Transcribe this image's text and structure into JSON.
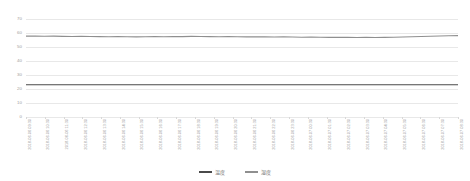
{
  "chart_data": {
    "type": "line",
    "title": "",
    "subtitle": "",
    "xlabel": "",
    "ylabel": "",
    "ylim": [
      0,
      70
    ],
    "yticks": [
      0,
      10,
      20,
      30,
      40,
      50,
      60,
      70
    ],
    "grid": true,
    "legend_position": "bottom-center",
    "x_tick_rotation": -90,
    "x": [
      "2018-06-06 09:30",
      "2018-06-06 10:00",
      "2018-06-06 10:30",
      "2018-06-06 11:00",
      "2018-06-06 11:30",
      "2018-06-06 12:00",
      "2018-06-06 12:30",
      "2018-06-06 13:00",
      "2018-06-06 13:30",
      "2018-06-06 14:00",
      "2018-06-06 14:30",
      "2018-06-06 15:00",
      "2018-06-06 15:30",
      "2018-06-06 16:00",
      "2018-06-06 16:30",
      "2018-06-06 17:00",
      "2018-06-06 17:30",
      "2018-06-06 18:00",
      "2018-06-06 18:30",
      "2018-06-06 19:00",
      "2018-06-06 19:30",
      "2018-06-06 20:00",
      "2018-06-06 20:30",
      "2018-06-06 21:00",
      "2018-06-06 21:30",
      "2018-06-06 22:00",
      "2018-06-06 22:30",
      "2018-06-06 23:00",
      "2018-06-06 23:30",
      "2018-06-07 00:00",
      "2018-06-07 00:30",
      "2018-06-07 01:00",
      "2018-06-07 01:30",
      "2018-06-07 02:00",
      "2018-06-07 02:30",
      "2018-06-07 03:00",
      "2018-06-07 03:30",
      "2018-06-07 04:00",
      "2018-06-07 04:30",
      "2018-06-07 05:00",
      "2018-06-07 05:30",
      "2018-06-07 06:00",
      "2018-06-07 06:30",
      "2018-06-07 07:00",
      "2018-06-07 07:30",
      "2018-06-07 08:00",
      "2018-06-07 08:30",
      "2018-06-07 09:00"
    ],
    "x_tick_labels": [
      "2018-06-06 09:30",
      "2018-06-06 10:30",
      "2018-06-06 11:30",
      "2018-06-06 12:30",
      "2018-06-06 13:30",
      "2018-06-06 14:30",
      "2018-06-06 15:30",
      "2018-06-06 16:30",
      "2018-06-06 17:30",
      "2018-06-06 18:30",
      "2018-06-06 19:30",
      "2018-06-06 20:30",
      "2018-06-06 21:30",
      "2018-06-06 22:30",
      "2018-06-06 23:30",
      "2018-06-07 00:30",
      "2018-06-07 01:30",
      "2018-06-07 02:30",
      "2018-06-07 03:30",
      "2018-06-07 04:30",
      "2018-06-07 05:30",
      "2018-06-07 06:30",
      "2018-06-07 07:30",
      "2018-06-07 08:30"
    ],
    "series": [
      {
        "name": "温度",
        "color": "#4a4a4a",
        "values": [
          23.0,
          23.0,
          23.0,
          23.0,
          23.0,
          23.0,
          23.0,
          23.0,
          23.0,
          23.0,
          23.0,
          23.0,
          23.0,
          23.0,
          23.0,
          23.0,
          23.0,
          23.0,
          23.0,
          23.0,
          23.0,
          23.0,
          23.0,
          23.0,
          23.0,
          23.0,
          23.0,
          23.0,
          23.0,
          23.0,
          23.0,
          23.0,
          23.0,
          23.0,
          23.0,
          23.0,
          23.0,
          23.0,
          23.0,
          23.0,
          23.0,
          23.0,
          23.0,
          23.0,
          23.0,
          23.0,
          23.0,
          23.0
        ]
      },
      {
        "name": "湿度",
        "color": "#8f8f8f",
        "values": [
          57.8,
          57.9,
          57.7,
          57.8,
          57.6,
          57.5,
          57.6,
          57.5,
          57.4,
          57.3,
          57.4,
          57.3,
          57.2,
          57.3,
          57.4,
          57.3,
          57.5,
          57.4,
          57.6,
          57.5,
          57.4,
          57.3,
          57.4,
          57.3,
          57.2,
          57.3,
          57.2,
          57.1,
          57.2,
          57.1,
          57.0,
          57.1,
          57.0,
          56.9,
          57.0,
          56.9,
          56.8,
          56.9,
          56.8,
          56.9,
          57.0,
          57.1,
          57.3,
          57.5,
          57.7,
          57.9,
          58.0,
          58.1
        ]
      }
    ]
  },
  "legend": {
    "items": [
      {
        "label": "温度",
        "color": "#4a4a4a"
      },
      {
        "label": "湿度",
        "color": "#8f8f8f"
      }
    ]
  }
}
